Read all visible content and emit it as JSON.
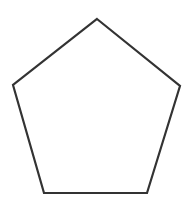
{
  "diagram": {
    "shape": "pentagon",
    "fill": "#ffffff",
    "stroke": "#333333",
    "stroke_width": 2.2,
    "points": "97,19 180,86 147,193 44,193 13,85"
  }
}
